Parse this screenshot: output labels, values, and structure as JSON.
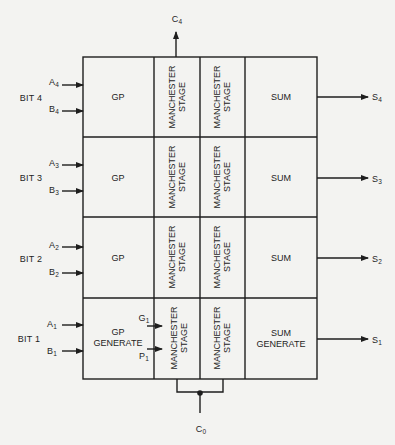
{
  "diagram": {
    "carry_out": {
      "label": "C",
      "sub": "4"
    },
    "carry_in": {
      "label": "C",
      "sub": "0"
    },
    "rows": [
      {
        "bit_label": "BIT 4",
        "input_a": {
          "label": "A",
          "sub": "4"
        },
        "input_b": {
          "label": "B",
          "sub": "4"
        },
        "gp_label": "GP",
        "stage1_lines": [
          "MANCHESTER",
          "STAGE"
        ],
        "stage2_lines": [
          "MANCHESTER",
          "STAGE"
        ],
        "sum_label": "SUM",
        "output": {
          "label": "S",
          "sub": "4"
        }
      },
      {
        "bit_label": "BIT 3",
        "input_a": {
          "label": "A",
          "sub": "3"
        },
        "input_b": {
          "label": "B",
          "sub": "3"
        },
        "gp_label": "GP",
        "stage1_lines": [
          "MANCHESTER",
          "STAGE"
        ],
        "stage2_lines": [
          "MANCHESTER",
          "STAGE"
        ],
        "sum_label": "SUM",
        "output": {
          "label": "S",
          "sub": "3"
        }
      },
      {
        "bit_label": "BIT 2",
        "input_a": {
          "label": "A",
          "sub": "2"
        },
        "input_b": {
          "label": "B",
          "sub": "2"
        },
        "gp_label": "GP",
        "stage1_lines": [
          "MANCHESTER",
          "STAGE"
        ],
        "stage2_lines": [
          "MANCHESTER",
          "STAGE"
        ],
        "sum_label": "SUM",
        "output": {
          "label": "S",
          "sub": "2"
        }
      },
      {
        "bit_label": "BIT 1",
        "input_a": {
          "label": "A",
          "sub": "1"
        },
        "input_b": {
          "label": "B",
          "sub": "1"
        },
        "gp_label_line1": "GP",
        "gp_label_line2": "GENERATE",
        "g_signal": {
          "label": "G",
          "sub": "1"
        },
        "p_signal": {
          "label": "P",
          "sub": "1"
        },
        "stage1_lines": [
          "MANCHESTER",
          "STAGE"
        ],
        "stage2_lines": [
          "MANCHESTER",
          "STAGE"
        ],
        "sum_label_line1": "SUM",
        "sum_label_line2": "GENERATE",
        "output": {
          "label": "S",
          "sub": "1"
        }
      }
    ]
  },
  "colors": {
    "background": "#f3f3f1",
    "line": "#1e1e1e",
    "header_clip_text": "#999999"
  }
}
